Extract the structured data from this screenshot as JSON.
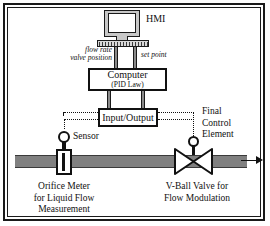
{
  "diagram": {
    "hmi": {
      "label": "HMI",
      "monitor_icon": "computer-monitor-icon",
      "keyboard_icon": "keyboard-icon"
    },
    "signals": {
      "flow_rate": "flow rate",
      "valve_position": "valve position",
      "set_point": "set point"
    },
    "computer": {
      "title": "Computer",
      "subtitle": "(PID Law)"
    },
    "io": {
      "title": "Input/Output"
    },
    "sensor": {
      "label": "Sensor",
      "icon": "sensor-circle-icon"
    },
    "orifice": {
      "line1": "Orifice Meter",
      "line2": "for Liquid Flow",
      "line3": "Measurement",
      "icon": "orifice-meter-icon"
    },
    "final_control_element": {
      "line1": "Final",
      "line2": "Control",
      "line3": "Element"
    },
    "valve": {
      "line1": "V-Ball Valve for",
      "line2": "Flow Modulation",
      "icon": "v-ball-valve-icon"
    },
    "pipe": {
      "icon": "pipe-icon",
      "flow_arrow_icon": "flow-direction-arrow-icon"
    },
    "colors": {
      "line": "#111111",
      "pipe_fill": "#808080",
      "monitor_fill": "#c8c8c8",
      "background": "#ffffff"
    }
  }
}
